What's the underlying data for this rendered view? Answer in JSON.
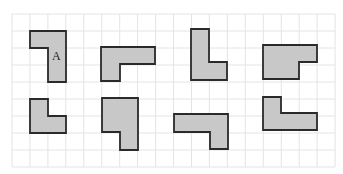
{
  "diagram": {
    "colors": {
      "background": "#ffffff",
      "grid": "#e4e4e4",
      "shape_fill": "#c8c8c8",
      "shape_stroke": "#2a2a2a"
    },
    "grid": {
      "x0": 12,
      "y0": 14,
      "cols": 18,
      "rows": 9,
      "cell_w": 17.95,
      "cell_h": 17.0
    },
    "shapes": [
      {
        "id": "A",
        "label": "A",
        "label_pos": [
          52,
          60
        ],
        "points": "30,31 66,31 66,82 48,82 48,48 30,48"
      },
      {
        "id": "2",
        "label": "",
        "points": "101,47 155,47 155,64 120,64 120,81 101,81"
      },
      {
        "id": "3",
        "label": "",
        "points": "191,29 209,29 209,62 227,62 227,80 191,80"
      },
      {
        "id": "4",
        "label": "",
        "points": "263,45 317,45 317,62 299,62 299,79 263,79"
      },
      {
        "id": "5",
        "label": "",
        "points": "30,99 48,99 48,116 66,116 66,133 30,133"
      },
      {
        "id": "6",
        "label": "",
        "points": "102,98 138,98 138,150 120,150 120,132 102,132"
      },
      {
        "id": "7",
        "label": "",
        "points": "174,114 228,114 228,149 210,149 210,132 174,132"
      },
      {
        "id": "8",
        "label": "",
        "points": "263,97 281,97 281,113 317,113 317,130 263,130"
      }
    ]
  }
}
